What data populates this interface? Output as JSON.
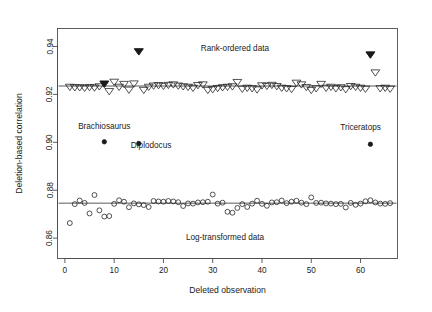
{
  "chart_data": {
    "type": "scatter",
    "title": "",
    "xlabel": "Deleted observation",
    "ylabel": "Deletion-based correlation",
    "xlim": [
      -1.5,
      67.5
    ],
    "ylim": [
      0.8515,
      0.9475
    ],
    "xticks": [
      0,
      10,
      20,
      30,
      40,
      50,
      60
    ],
    "xtick_labels": [
      "0",
      "10",
      "20",
      "30",
      "40",
      "50",
      "60"
    ],
    "yticks": [
      0.86,
      0.88,
      0.9,
      0.92,
      0.94
    ],
    "ytick_labels": [
      "0.86",
      "0.88",
      "0.90",
      "0.92",
      "0.94"
    ],
    "grid": false,
    "legend": false,
    "box": true,
    "reference_lines": [
      {
        "name": "rank-ordered-mean",
        "y": 0.9235
      },
      {
        "name": "log-transformed-mean",
        "y": 0.8746
      }
    ],
    "annotations": [
      {
        "name": "rank-ordered-data-label",
        "text": "Rank-ordered data",
        "x": 34.5,
        "y": 0.9383
      },
      {
        "name": "log-transformed-data-label",
        "text": "Log-transformed data",
        "x": 32.5,
        "y": 0.8592
      },
      {
        "name": "brachiosaurus-label",
        "text": "Brachiosaurus",
        "x": 8.0,
        "y": 0.9055
      },
      {
        "name": "diplodocus-label",
        "text": "Diplodocus",
        "x": 17.5,
        "y": 0.8975
      },
      {
        "name": "triceratops-label",
        "text": "Triceratops",
        "x": 60.0,
        "y": 0.9053
      }
    ],
    "series": [
      {
        "name": "Rank-ordered data",
        "marker": "open-triangle-down",
        "x": [
          1,
          2,
          3,
          4,
          5,
          6,
          7,
          8,
          9,
          10,
          11,
          12,
          13,
          14,
          15,
          16,
          17,
          18,
          19,
          20,
          21,
          22,
          23,
          24,
          25,
          26,
          27,
          28,
          29,
          30,
          31,
          32,
          33,
          34,
          35,
          36,
          37,
          38,
          39,
          40,
          41,
          42,
          43,
          44,
          45,
          46,
          47,
          48,
          49,
          50,
          51,
          52,
          53,
          54,
          55,
          56,
          57,
          58,
          59,
          60,
          61,
          62,
          63,
          64,
          65,
          66
        ],
        "values": [
          0.9232,
          0.923,
          0.923,
          0.9228,
          0.9231,
          0.9229,
          0.9234,
          0.9245,
          0.9214,
          0.9253,
          0.9232,
          0.9244,
          0.922,
          0.9246,
          0.938,
          0.9219,
          0.9232,
          0.9237,
          0.9239,
          0.9236,
          0.924,
          0.9242,
          0.9237,
          0.9234,
          0.9232,
          0.9228,
          0.9239,
          0.9242,
          0.9219,
          0.9222,
          0.9227,
          0.923,
          0.9232,
          0.9234,
          0.9252,
          0.9224,
          0.9228,
          0.9226,
          0.9221,
          0.9238,
          0.9236,
          0.924,
          0.9235,
          0.9228,
          0.9226,
          0.9223,
          0.9249,
          0.9242,
          0.9231,
          0.9219,
          0.9226,
          0.9244,
          0.9228,
          0.9232,
          0.9226,
          0.923,
          0.9222,
          0.9235,
          0.9232,
          0.9228,
          0.9224,
          0.9367,
          0.9292,
          0.9226,
          0.9228,
          0.9224
        ]
      },
      {
        "name": "Log-transformed data",
        "marker": "open-circle",
        "x": [
          1,
          2,
          3,
          4,
          5,
          6,
          7,
          8,
          9,
          10,
          11,
          12,
          13,
          14,
          15,
          16,
          17,
          18,
          19,
          20,
          21,
          22,
          23,
          24,
          25,
          26,
          27,
          28,
          29,
          30,
          31,
          32,
          33,
          34,
          35,
          36,
          37,
          38,
          39,
          40,
          41,
          42,
          43,
          44,
          45,
          46,
          47,
          48,
          49,
          50,
          51,
          52,
          53,
          54,
          55,
          56,
          57,
          58,
          59,
          60,
          61,
          62,
          63,
          64,
          65,
          66
        ],
        "values": [
          0.8663,
          0.8742,
          0.8757,
          0.8747,
          0.8703,
          0.878,
          0.8716,
          0.869,
          0.8692,
          0.8743,
          0.8758,
          0.8752,
          0.8729,
          0.8745,
          0.8741,
          0.8738,
          0.873,
          0.8755,
          0.8753,
          0.8752,
          0.8755,
          0.8753,
          0.875,
          0.8734,
          0.8745,
          0.8744,
          0.8749,
          0.875,
          0.8752,
          0.8782,
          0.8744,
          0.8748,
          0.871,
          0.8706,
          0.8726,
          0.8742,
          0.873,
          0.8744,
          0.8756,
          0.8743,
          0.8735,
          0.8749,
          0.875,
          0.8757,
          0.8746,
          0.8752,
          0.8756,
          0.8748,
          0.8742,
          0.877,
          0.8747,
          0.8748,
          0.8745,
          0.8744,
          0.8742,
          0.8743,
          0.8728,
          0.8747,
          0.8739,
          0.8744,
          0.8754,
          0.8758,
          0.8749,
          0.8744,
          0.8743,
          0.8746
        ]
      },
      {
        "name": "Rank-ordered outliers",
        "marker": "filled-triangle-down",
        "x": [
          8,
          15,
          62
        ],
        "values": [
          0.9245,
          0.938,
          0.9367
        ]
      },
      {
        "name": "Influential observations",
        "marker": "filled-circle",
        "x": [
          8,
          15,
          62
        ],
        "values": [
          0.9002,
          0.8995,
          0.8992
        ]
      }
    ]
  },
  "colors": {
    "axis": "#4d4d4d",
    "marker": "#1a1a1a",
    "reference_line": "#5a5a5a",
    "background": "#ffffff"
  }
}
